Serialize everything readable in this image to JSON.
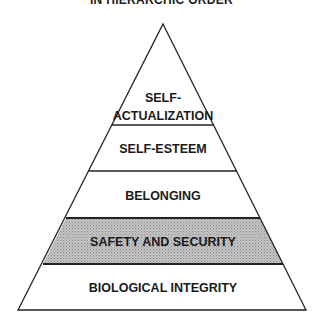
{
  "title": "IN HIERARCHIC ORDER",
  "pyramid": {
    "levels": [
      {
        "label_line1": "SELF-",
        "label_line2": "ACTUALIZATION"
      },
      {
        "label": "SELF-ESTEEM"
      },
      {
        "label": "BELONGING"
      },
      {
        "label": "SAFETY AND SECURITY",
        "highlighted": true,
        "fill": "#bdbdbd"
      },
      {
        "label": "BIOLOGICAL INTEGRITY"
      }
    ]
  }
}
